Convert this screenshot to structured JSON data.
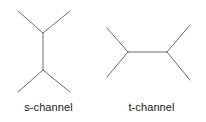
{
  "figure": {
    "background_color": "#ffffff",
    "line_color": "#6b6b6b",
    "text_color": "#222222",
    "line_width": 1
  },
  "diagrams": [
    {
      "id": "s-channel",
      "caption": "s-channel",
      "description": "Feynman diagram with vertical internal propagator joining two three-point vertices",
      "vertices": [
        {
          "name": "top-vertex",
          "x": 43,
          "y": 33
        },
        {
          "name": "bottom-vertex",
          "x": 43,
          "y": 70
        }
      ],
      "lines": [
        {
          "name": "incoming-leg-upper-left",
          "x1": 18,
          "y1": 11,
          "x2": 43,
          "y2": 33
        },
        {
          "name": "incoming-leg-upper-right",
          "x1": 70,
          "y1": 11,
          "x2": 43,
          "y2": 33
        },
        {
          "name": "internal-propagator",
          "x1": 43,
          "y1": 33,
          "x2": 43,
          "y2": 70
        },
        {
          "name": "outgoing-leg-lower-left",
          "x1": 43,
          "y1": 70,
          "x2": 18,
          "y2": 92
        },
        {
          "name": "outgoing-leg-lower-right",
          "x1": 43,
          "y1": 70,
          "x2": 70,
          "y2": 92
        }
      ]
    },
    {
      "id": "t-channel",
      "caption": "t-channel",
      "description": "Feynman diagram with horizontal internal propagator joining two three-point vertices",
      "vertices": [
        {
          "name": "left-vertex",
          "x": 128,
          "y": 52
        },
        {
          "name": "right-vertex",
          "x": 167,
          "y": 52
        }
      ],
      "lines": [
        {
          "name": "incoming-leg-upper-left",
          "x1": 107,
          "y1": 28,
          "x2": 128,
          "y2": 52
        },
        {
          "name": "incoming-leg-lower-left",
          "x1": 107,
          "y1": 77,
          "x2": 128,
          "y2": 52
        },
        {
          "name": "internal-propagator",
          "x1": 128,
          "y1": 52,
          "x2": 167,
          "y2": 52
        },
        {
          "name": "outgoing-leg-upper-right",
          "x1": 167,
          "y1": 52,
          "x2": 190,
          "y2": 25
        },
        {
          "name": "outgoing-leg-lower-right",
          "x1": 167,
          "y1": 52,
          "x2": 190,
          "y2": 80
        }
      ]
    }
  ]
}
